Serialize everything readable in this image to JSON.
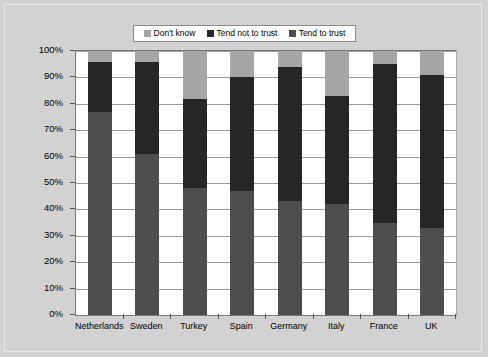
{
  "chart_data": {
    "type": "bar",
    "stacked": true,
    "title": "",
    "xlabel": "",
    "ylabel": "",
    "ylim": [
      0,
      100
    ],
    "grid": true,
    "legend_position": "top-center",
    "categories": [
      "Netherlands",
      "Sweden",
      "Turkey",
      "Spain",
      "Germany",
      "Italy",
      "France",
      "UK"
    ],
    "ytick_labels": [
      "0%",
      "10%",
      "20%",
      "30%",
      "40%",
      "50%",
      "60%",
      "70%",
      "80%",
      "90%",
      "100%"
    ],
    "ytick_values": [
      0,
      10,
      20,
      30,
      40,
      50,
      60,
      70,
      80,
      90,
      100
    ],
    "series": [
      {
        "name": "Tend to trust",
        "color": "#4d4d4d",
        "values": [
          77,
          61,
          48,
          47,
          43,
          42,
          35,
          33
        ]
      },
      {
        "name": "Tend not to trust",
        "color": "#262626",
        "values": [
          19,
          35,
          34,
          43,
          51,
          41,
          60,
          58
        ]
      },
      {
        "name": "Don't know",
        "color": "#a6a6a6",
        "values": [
          4,
          4,
          18,
          10,
          6,
          17,
          5,
          9
        ]
      }
    ],
    "cumulative_tops": {
      "tend_to_trust": [
        77,
        61,
        48,
        47,
        43,
        42,
        35,
        33
      ],
      "tend_not_to_trust": [
        96,
        96,
        82,
        90,
        94,
        83,
        95,
        91
      ],
      "dont_know": [
        100,
        100,
        100,
        100,
        100,
        100,
        100,
        100
      ]
    }
  },
  "legend": {
    "items": [
      {
        "label": "Don't know",
        "color": "#a6a6a6"
      },
      {
        "label": "Tend not to trust",
        "color": "#262626"
      },
      {
        "label": "Tend to trust",
        "color": "#4d4d4d"
      }
    ]
  },
  "colors": {
    "background": "#d2d2d2",
    "plot_background": "#ffffff",
    "gridline": "#9a9a9a",
    "axis": "#777777",
    "dont_know": "#a6a6a6",
    "tend_not_to_trust": "#262626",
    "tend_to_trust": "#4d4d4d"
  }
}
